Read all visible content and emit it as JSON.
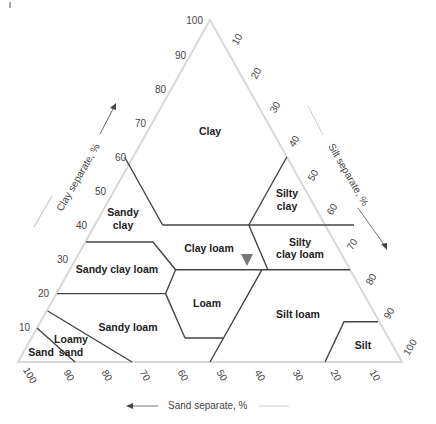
{
  "diagram": {
    "type": "soil-texture-triangle",
    "geometry": {
      "apex": [
        210,
        20
      ],
      "left": [
        18,
        362
      ],
      "right": [
        402,
        362
      ]
    },
    "axes": {
      "clay": {
        "title": "Clay separate, %",
        "ticks": [
          "10",
          "20",
          "30",
          "40",
          "50",
          "60",
          "70",
          "80",
          "90",
          "100"
        ]
      },
      "silt": {
        "title": "Silt separate, %",
        "ticks": [
          "10",
          "20",
          "30",
          "40",
          "50",
          "60",
          "70",
          "80",
          "90",
          "100"
        ]
      },
      "sand": {
        "title": "Sand separate, %",
        "ticks": [
          "100",
          "90",
          "80",
          "70",
          "60",
          "50",
          "40",
          "30",
          "20",
          "10"
        ]
      }
    },
    "regions": [
      {
        "name": "Clay",
        "label": [
          "Clay"
        ]
      },
      {
        "name": "Sandy clay",
        "label": [
          "Sandy",
          "clay"
        ]
      },
      {
        "name": "Silty clay",
        "label": [
          "Silty",
          "clay"
        ]
      },
      {
        "name": "Clay loam",
        "label": [
          "Clay loam"
        ]
      },
      {
        "name": "Silty clay loam",
        "label": [
          "Silty",
          "clay loam"
        ]
      },
      {
        "name": "Sandy clay loam",
        "label": [
          "Sandy clay loam"
        ]
      },
      {
        "name": "Loam",
        "label": [
          "Loam"
        ]
      },
      {
        "name": "Silt loam",
        "label": [
          "Silt loam"
        ]
      },
      {
        "name": "Sandy loam",
        "label": [
          "Sandy loam"
        ]
      },
      {
        "name": "Loamy sand",
        "label": [
          "Loamy",
          "sand"
        ]
      },
      {
        "name": "Sand",
        "label": [
          "Sand"
        ]
      },
      {
        "name": "Silt",
        "label": [
          "Silt"
        ]
      }
    ],
    "marker": {
      "shape": "triangle-down",
      "color": "#777777",
      "note": "sample point in clay loam"
    },
    "colors": {
      "frame": "#d8d8d8",
      "boundary": "#444444",
      "text": "#222222",
      "tick": "#444444"
    }
  }
}
